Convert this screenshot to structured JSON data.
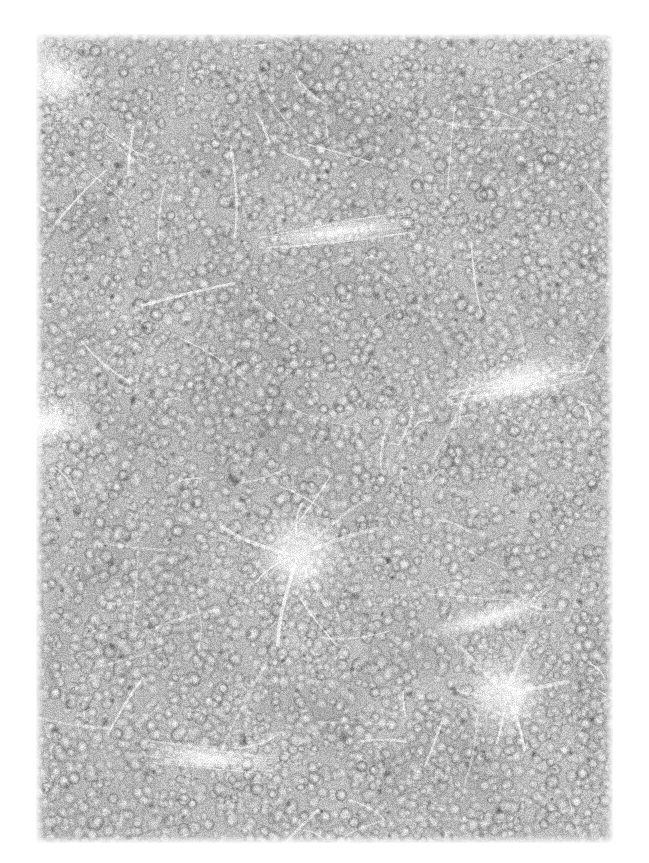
{
  "page": {
    "width": 649,
    "height": 863,
    "background_color": "#ffffff",
    "kind": "histopathology-micrograph",
    "caption": "",
    "overlay_text": "",
    "scale_bar_label": "",
    "magnification_label": ""
  },
  "micrograph": {
    "left": 36,
    "top": 34,
    "width": 577,
    "height": 809,
    "stain": "hematoxylin-and-eosin-grayscale",
    "modality": "brightfield-light-microscopy",
    "color_mode": "grayscale",
    "tissue_description": "densely-packed-small-round-cells",
    "palette": {
      "paper_white": "#ffffff",
      "tissue_base": "#b8b8b6",
      "cell_highlight": "#efeeec",
      "cell_midtone": "#a9a9a7",
      "cell_shadow": "#7c7c7a",
      "nucleus_dark": "#5a5a58",
      "stroma_white": "#fdfdfc",
      "deep_dark": "#4a4a48"
    },
    "texture": {
      "cell_count": 7200,
      "cell_radius_min": 3.6,
      "cell_radius_max": 7.2,
      "nucleus_count": 360,
      "stroma_streak_count": 150,
      "grain_amount": 0.16,
      "blur_radius": 0.7,
      "seed": 20240517
    },
    "tone_field": [
      {
        "name": "upper-left-bright-margin",
        "cx": 0.03,
        "cy": 0.05,
        "rx": 0.1,
        "ry": 0.12,
        "delta": 0.3
      },
      {
        "name": "upper-center-dark-band",
        "cx": 0.46,
        "cy": 0.1,
        "rx": 0.34,
        "ry": 0.11,
        "delta": -0.14
      },
      {
        "name": "upper-right-dark-patch",
        "cx": 0.86,
        "cy": 0.14,
        "rx": 0.18,
        "ry": 0.12,
        "delta": -0.12
      },
      {
        "name": "left-mid-bright-band",
        "cx": 0.02,
        "cy": 0.48,
        "rx": 0.09,
        "ry": 0.1,
        "delta": 0.34
      },
      {
        "name": "center-dark-mass",
        "cx": 0.4,
        "cy": 0.42,
        "rx": 0.26,
        "ry": 0.18,
        "delta": -0.12
      },
      {
        "name": "right-mid-light",
        "cx": 0.8,
        "cy": 0.4,
        "rx": 0.2,
        "ry": 0.16,
        "delta": 0.1
      },
      {
        "name": "lower-left-dark",
        "cx": 0.22,
        "cy": 0.68,
        "rx": 0.22,
        "ry": 0.16,
        "delta": -0.1
      },
      {
        "name": "lower-right-light",
        "cx": 0.78,
        "cy": 0.8,
        "rx": 0.22,
        "ry": 0.18,
        "delta": 0.12
      },
      {
        "name": "bottom-center-mid",
        "cx": 0.48,
        "cy": 0.93,
        "rx": 0.3,
        "ry": 0.1,
        "delta": 0.04
      },
      {
        "name": "top-right-corner-light",
        "cx": 0.98,
        "cy": 0.02,
        "rx": 0.08,
        "ry": 0.06,
        "delta": 0.22
      }
    ],
    "structures": [
      {
        "name": "central-stellate-vessel",
        "type": "stromal-vessel",
        "cx": 0.455,
        "cy": 0.645,
        "rx": 0.075,
        "ry": 0.06,
        "brightness": 0.96,
        "arm_count": 7
      },
      {
        "name": "lower-right-stellate-vessel",
        "type": "stromal-vessel",
        "cx": 0.815,
        "cy": 0.818,
        "rx": 0.07,
        "ry": 0.052,
        "brightness": 0.95,
        "arm_count": 6
      },
      {
        "name": "right-mid-fibrous-band",
        "type": "fibrous-septum",
        "cx": 0.835,
        "cy": 0.43,
        "rx": 0.12,
        "ry": 0.028,
        "brightness": 0.9,
        "angle": -12
      },
      {
        "name": "upper-mid-fibrous-streak",
        "type": "fibrous-septum",
        "cx": 0.52,
        "cy": 0.245,
        "rx": 0.135,
        "ry": 0.016,
        "brightness": 0.88,
        "angle": -8
      },
      {
        "name": "lower-right-vertical-septum",
        "type": "fibrous-septum",
        "cx": 0.79,
        "cy": 0.72,
        "rx": 0.022,
        "ry": 0.085,
        "brightness": 0.88,
        "angle": 74
      },
      {
        "name": "upper-left-edge-streak",
        "type": "capsule-edge",
        "cx": 0.035,
        "cy": 0.055,
        "rx": 0.055,
        "ry": 0.035,
        "brightness": 0.94,
        "angle": 40
      },
      {
        "name": "bottom-left-streak",
        "type": "fibrous-septum",
        "cx": 0.3,
        "cy": 0.895,
        "rx": 0.11,
        "ry": 0.018,
        "brightness": 0.86,
        "angle": 6
      },
      {
        "name": "left-mid-capsule-band",
        "type": "capsule-edge",
        "cx": 0.015,
        "cy": 0.48,
        "rx": 0.04,
        "ry": 0.055,
        "brightness": 0.95,
        "angle": 88
      }
    ]
  }
}
